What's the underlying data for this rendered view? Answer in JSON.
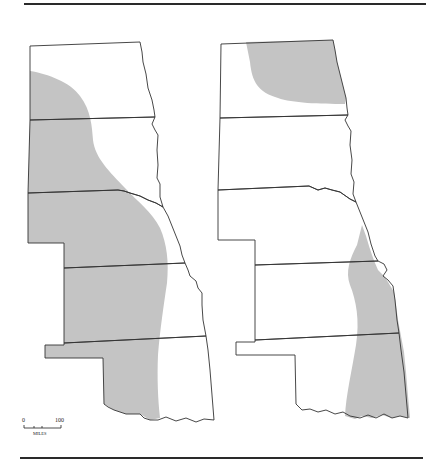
{
  "figure": {
    "type": "twin-panel shaded regional map",
    "panels": [
      {
        "id": "left",
        "description": "Great Plains states (ND, SD, NE, KS, OK) with western shaded region",
        "shade_color": "#c4c4c4"
      },
      {
        "id": "right",
        "description": "Great Plains states (ND, SD, NE, KS, OK) with shaded NE North Dakota and eastern NE/KS/OK band",
        "shade_color": "#c4c4c4"
      }
    ],
    "scale_bar": {
      "start_label": "0",
      "end_label": "100",
      "unit_label": "MILES"
    }
  }
}
